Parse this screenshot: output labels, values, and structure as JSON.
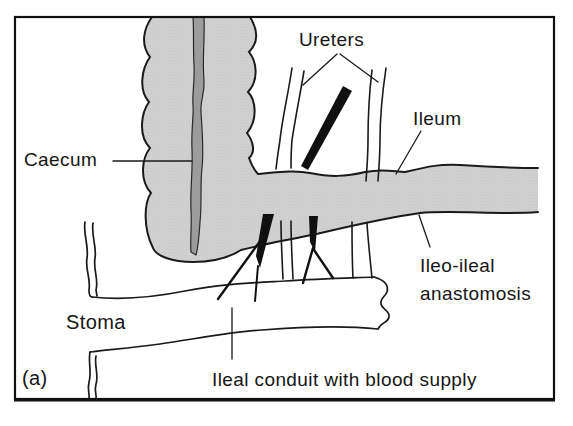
{
  "figure": {
    "panel_label": "(a)",
    "labels": {
      "ureters": "Ureters",
      "ileum": "Ileum",
      "caecum": "Caecum",
      "anastomosis_line1": "Ileo-ileal",
      "anastomosis_line2": "anastomosis",
      "stoma": "Stoma",
      "conduit_caption": "Ileal conduit with blood supply"
    },
    "colors": {
      "intestine_fill": "#cccccc",
      "taenia_fill": "#9c9c9c",
      "outline": "#1a1a1a",
      "background": "#ffffff"
    }
  }
}
